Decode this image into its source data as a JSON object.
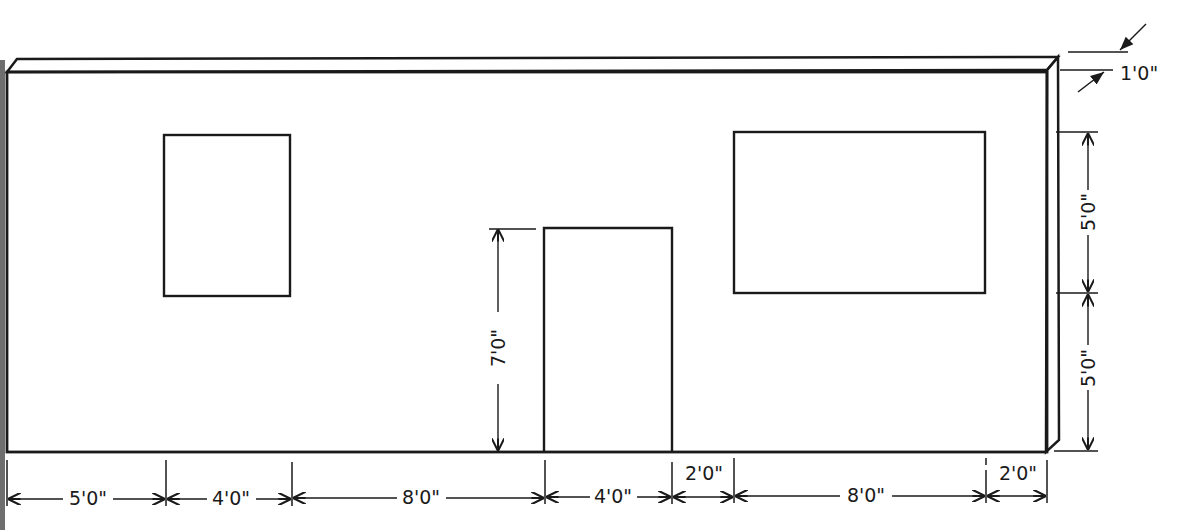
{
  "diagram": {
    "type": "wall-elevation",
    "colors": {
      "line": "#1a1a1a",
      "background": "#ffffff",
      "hatch": "#555555"
    },
    "wall_thickness": {
      "label": "1'0\""
    },
    "right_heights": [
      {
        "id": "upper",
        "label": "5'0\""
      },
      {
        "id": "lower",
        "label": "5'0\""
      }
    ],
    "door_height": {
      "label": "7'0\""
    },
    "bottom_dimensions": [
      {
        "id": "d1",
        "label": "5'0\""
      },
      {
        "id": "d2",
        "label": "4'0\""
      },
      {
        "id": "d3",
        "label": "8'0\""
      },
      {
        "id": "d4",
        "label": "4'0\""
      },
      {
        "id": "d5",
        "label": "2'0\""
      },
      {
        "id": "d6",
        "label": "8'0\""
      },
      {
        "id": "d7",
        "label": "2'0\""
      }
    ],
    "openings": [
      {
        "id": "small-window",
        "kind": "window"
      },
      {
        "id": "door",
        "kind": "door"
      },
      {
        "id": "large-window",
        "kind": "window"
      }
    ]
  }
}
